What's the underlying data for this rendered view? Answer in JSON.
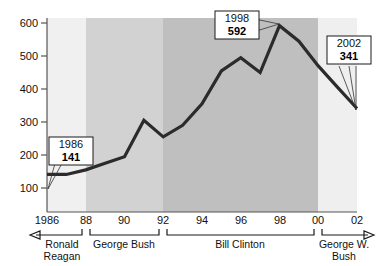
{
  "chart_data": {
    "type": "line",
    "title": "",
    "xlabel": "",
    "ylabel": "",
    "xlim": [
      1986,
      2002
    ],
    "ylim": [
      0,
      600
    ],
    "grid": false,
    "legend": "none",
    "x": [
      1986,
      1987,
      1988,
      1989,
      1990,
      1991,
      1992,
      1993,
      1994,
      1995,
      1996,
      1997,
      1998,
      1999,
      2000,
      2001,
      2002
    ],
    "values": [
      141,
      141,
      155,
      175,
      195,
      305,
      255,
      290,
      355,
      455,
      495,
      450,
      592,
      545,
      470,
      405,
      341
    ],
    "x_tick_labels": [
      "1986",
      "88",
      "90",
      "92",
      "94",
      "96",
      "98",
      "00",
      "02"
    ],
    "x_tick_values": [
      1986,
      1988,
      1990,
      1992,
      1994,
      1996,
      1998,
      2000,
      2002
    ],
    "y_tick_labels": [
      "100",
      "200",
      "300",
      "400",
      "500",
      "600"
    ],
    "y_tick_values": [
      100,
      200,
      300,
      400,
      500,
      600
    ],
    "annotations": [
      {
        "year": "1986",
        "value": "141",
        "x": 1986,
        "y": 141
      },
      {
        "year": "1998",
        "value": "592",
        "x": 1998,
        "y": 592
      },
      {
        "year": "2002",
        "value": "341",
        "x": 2002,
        "y": 341
      }
    ],
    "eras": [
      {
        "name": "Ronald Reagan",
        "line1": "Ronald",
        "line2": "Reagan",
        "start": 1986,
        "end": 1988,
        "shade": "#f0f0f0",
        "arrow": "left"
      },
      {
        "name": "George Bush",
        "line1": "George Bush",
        "line2": "",
        "start": 1988,
        "end": 1992,
        "shade": "#d2d2d2",
        "arrow": "none"
      },
      {
        "name": "Bill Clinton",
        "line1": "Bill Clinton",
        "line2": "",
        "start": 1992,
        "end": 2000,
        "shade": "#bfbfbf",
        "arrow": "none"
      },
      {
        "name": "George W. Bush",
        "line1": "George W.",
        "line2": "Bush",
        "start": 2000,
        "end": 2002,
        "shade": "#efefef",
        "arrow": "right"
      }
    ],
    "colors": {
      "line": "#2b2b2b",
      "axis": "#555555",
      "text": "#111111",
      "background": "#ffffff"
    }
  }
}
